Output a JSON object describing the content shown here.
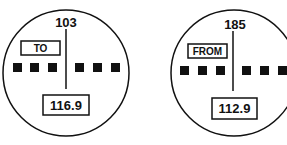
{
  "instruments": [
    {
      "course": "103",
      "flag": "TO",
      "frequency": "116.9"
    },
    {
      "course": "185",
      "flag": "FROM",
      "frequency": "112.9"
    }
  ]
}
